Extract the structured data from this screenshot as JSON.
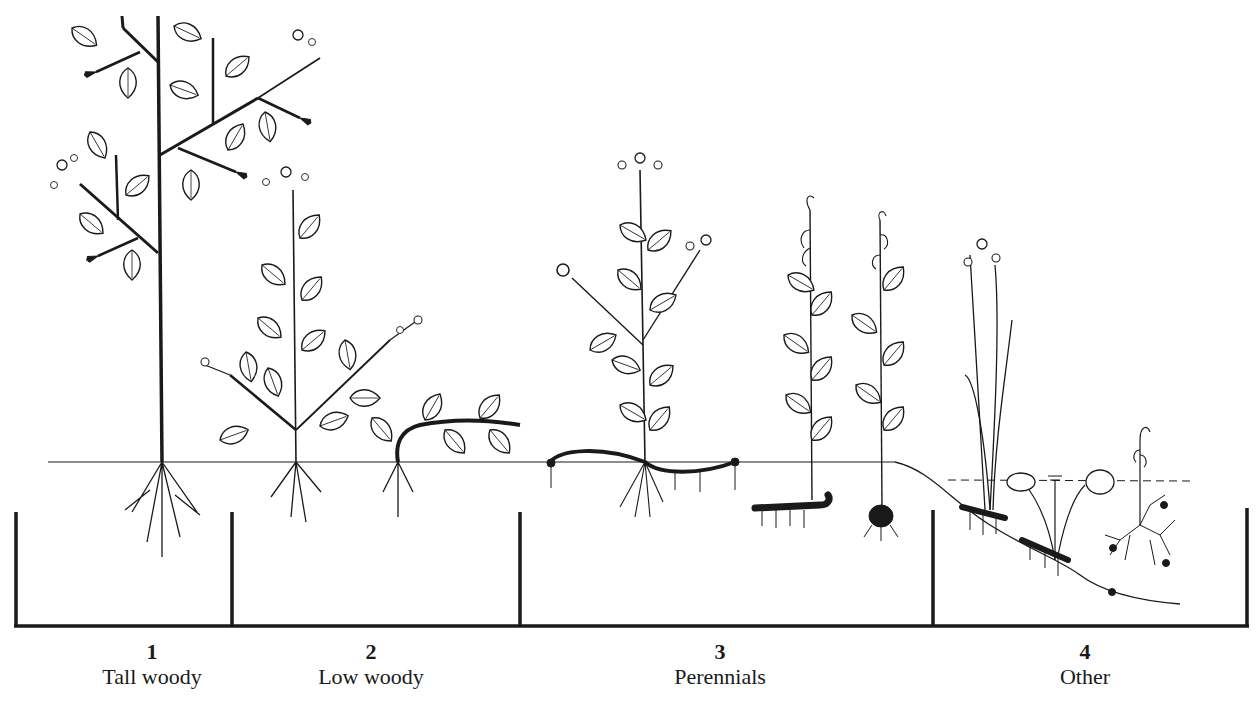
{
  "diagram": {
    "type": "plant-growth-forms",
    "ground_line_y": 462,
    "baseline_y": 626,
    "colors": {
      "ink": "#1a1a1a",
      "background": "#ffffff"
    },
    "groups": [
      {
        "number": "1",
        "label": "Tall woody",
        "x_center": 152,
        "bracket": [
          16,
          232
        ]
      },
      {
        "number": "2",
        "label": "Low woody",
        "x_center": 371,
        "bracket": [
          232,
          520
        ]
      },
      {
        "number": "3",
        "label": "Perennials",
        "x_center": 720,
        "bracket": [
          520,
          933
        ]
      },
      {
        "number": "4",
        "label": "Other",
        "x_center": 1085,
        "bracket": [
          933,
          1248
        ]
      }
    ]
  }
}
